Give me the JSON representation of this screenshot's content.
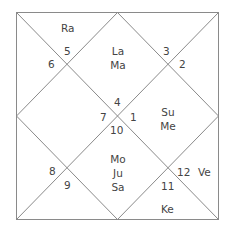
{
  "chart": {
    "style": "North Indian",
    "line_color": "#8a8a8a",
    "text_color": "#444444"
  },
  "houses": [
    {
      "sign": "4",
      "planets": [
        "La",
        "Ma"
      ]
    },
    {
      "sign": "3",
      "planets": []
    },
    {
      "sign": "2",
      "planets": []
    },
    {
      "sign": "1",
      "planets": [
        "Su",
        "Me"
      ]
    },
    {
      "sign": "12",
      "planets": [
        "Ve"
      ]
    },
    {
      "sign": "11",
      "planets": [
        "Ke"
      ]
    },
    {
      "sign": "10",
      "planets": [
        "Mo",
        "Ju",
        "Sa"
      ]
    },
    {
      "sign": "9",
      "planets": []
    },
    {
      "sign": "8",
      "planets": []
    },
    {
      "sign": "7",
      "planets": []
    },
    {
      "sign": "6",
      "planets": []
    },
    {
      "sign": "5",
      "planets": [
        "Ra"
      ]
    }
  ],
  "labels": {
    "h1_sign": "4",
    "h1_p1": "La",
    "h1_p2": "Ma",
    "h2_sign": "3",
    "h3_sign": "2",
    "h4_sign": "1",
    "h4_p1": "Su",
    "h4_p2": "Me",
    "h5_sign": "12",
    "h5_p1": "Ve",
    "h6_sign": "11",
    "h6_p1": "Ke",
    "h7_sign": "10",
    "h7_p1": "Mo",
    "h7_p2": "Ju",
    "h7_p3": "Sa",
    "h8_sign": "9",
    "h9_sign": "8",
    "h10_sign": "7",
    "h11_sign": "6",
    "h12_sign": "5",
    "h12_p1": "Ra"
  }
}
